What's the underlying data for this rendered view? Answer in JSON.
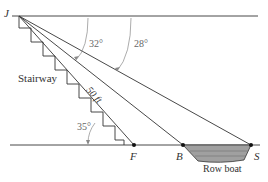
{
  "diagram": {
    "points": {
      "J": {
        "label": "J",
        "x": 12,
        "y": 14
      },
      "F": {
        "label": "F",
        "x": 134,
        "y": 145
      },
      "B": {
        "label": "B",
        "x": 183,
        "y": 145
      },
      "S": {
        "label": "S",
        "x": 251,
        "y": 145
      }
    },
    "labels": {
      "stairway": "Stairway",
      "hypotenuse": "50 ft",
      "boat": "Row boat"
    },
    "angles": {
      "angle_JB": "32°",
      "angle_JS": "28°",
      "angle_F": "35°"
    },
    "colors": {
      "line": "#333333",
      "arc": "#777777",
      "boat_fill": "#9a9a9a",
      "text": "#333333"
    }
  }
}
